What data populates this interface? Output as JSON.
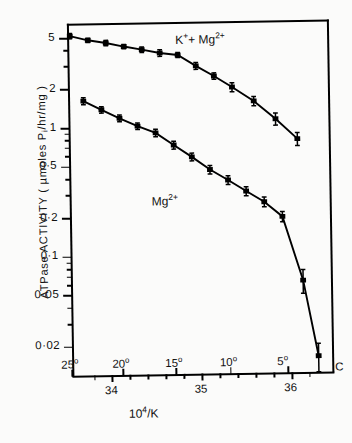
{
  "chart_data": {
    "type": "line",
    "title": "",
    "xlabel": "10⁴/K",
    "ylabel": "ATPase ACTIVITY ( µmoles Pᵢ/hr/mg )",
    "yscale": "log",
    "ylim": [
      0.012,
      6.5
    ],
    "xlim": [
      33.55,
      36.45
    ],
    "grid": false,
    "legend_position": "inline-annotation",
    "y_ticks": [
      {
        "value": 5,
        "label": "5",
        "major": true
      },
      {
        "value": 2,
        "label": "2",
        "major": true
      },
      {
        "value": 1,
        "label": "1",
        "major": true
      },
      {
        "value": 0.5,
        "label": "0·5",
        "major": true
      },
      {
        "value": 0.2,
        "label": "0·2",
        "major": true
      },
      {
        "value": 0.1,
        "label": "0·1",
        "major": true
      },
      {
        "value": 0.05,
        "label": "0·05",
        "major": true
      },
      {
        "value": 0.02,
        "label": "0·02",
        "major": true
      }
    ],
    "y_minor_ticks": [
      4,
      3,
      0.9,
      0.8,
      0.7,
      0.6,
      0.4,
      0.3,
      0.09,
      0.08,
      0.07,
      0.06,
      0.04,
      0.03
    ],
    "x_ticks_bottom": [
      {
        "value": 34,
        "label": "34"
      },
      {
        "value": 35,
        "label": "35"
      },
      {
        "value": 36,
        "label": "36"
      }
    ],
    "x_minor_ticks_bottom": [
      33.8,
      34.2,
      34.4,
      34.6,
      34.8,
      35.2,
      35.4,
      35.6,
      35.8,
      36.2
    ],
    "x_ticks_top_temperature": [
      {
        "celsius": 25,
        "label": "25°",
        "inv_k": 33.55
      },
      {
        "celsius": 20,
        "label": "20°",
        "inv_k": 34.12
      },
      {
        "celsius": 15,
        "label": "15°",
        "inv_k": 34.71
      },
      {
        "celsius": 10,
        "label": "10°",
        "inv_k": 35.32
      },
      {
        "celsius": 5,
        "label": "5°",
        "inv_k": 35.96
      }
    ],
    "temperature_unit_label": "C",
    "series": [
      {
        "name": "K⁺ + Mg²⁺",
        "label_html": "K<sup>+</sup>+ Mg<sup>2+</sup>",
        "marker": "filled-square",
        "break_point_celsius": 15,
        "x": [
          33.58,
          33.78,
          33.98,
          34.18,
          34.38,
          34.58,
          34.78,
          34.98,
          35.18,
          35.38,
          35.62,
          35.86,
          36.1
        ],
        "y": [
          5.2,
          4.8,
          4.55,
          4.25,
          4.0,
          3.75,
          3.6,
          2.95,
          2.45,
          2.0,
          1.55,
          1.12,
          0.78
        ],
        "yerr": [
          0.25,
          0.18,
          0.22,
          0.16,
          0.2,
          0.22,
          0.16,
          0.18,
          0.14,
          0.16,
          0.13,
          0.12,
          0.09
        ]
      },
      {
        "name": "Mg²⁺",
        "label_html": "Mg<sup>2+</sup>",
        "marker": "filled-square",
        "break_point_celsius": 7,
        "x": [
          33.72,
          33.92,
          34.12,
          34.32,
          34.52,
          34.72,
          34.92,
          35.12,
          35.32,
          35.52,
          35.72,
          35.92,
          36.14,
          36.3
        ],
        "y": [
          1.62,
          1.38,
          1.18,
          1.02,
          0.9,
          0.72,
          0.58,
          0.46,
          0.38,
          0.31,
          0.255,
          0.195,
          0.062,
          0.016
        ],
        "yerr": [
          0.1,
          0.08,
          0.07,
          0.06,
          0.06,
          0.05,
          0.04,
          0.035,
          0.03,
          0.025,
          0.022,
          0.018,
          0.013,
          0.004
        ]
      }
    ]
  },
  "axis": {
    "y_title": "ATPase ACTIVITY ( µmoles P/hr/mg )",
    "y_title_sub": "i",
    "x_title_base": "10",
    "x_title_sup": "4",
    "x_title_rest": "/K"
  },
  "annotations": {
    "upper_series_base": "K",
    "upper_series_sup1": "+",
    "upper_series_mid": "+ Mg",
    "upper_series_sup2": "2+",
    "lower_series_base": "Mg",
    "lower_series_sup": "2+",
    "celsius_marker": "C"
  },
  "colors": {
    "line": "#000000",
    "marker": "#000000",
    "background": "#fbfbfa",
    "axis": "#000000"
  }
}
